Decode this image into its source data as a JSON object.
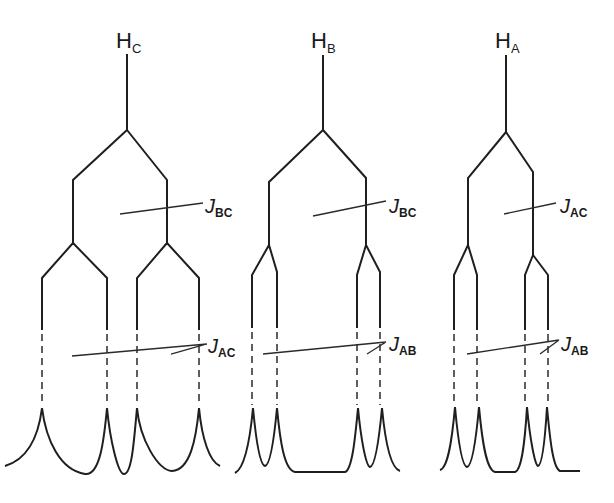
{
  "diagram": {
    "type": "NMR splitting tree diagram",
    "trees": [
      {
        "id": "HC",
        "label_main": "H",
        "label_sub": "C",
        "first_coupling": {
          "main": "J",
          "sub": "BC"
        },
        "second_coupling": {
          "main": "J",
          "sub": "AC"
        },
        "peak_count": 4
      },
      {
        "id": "HB",
        "label_main": "H",
        "label_sub": "B",
        "first_coupling": {
          "main": "J",
          "sub": "BC"
        },
        "second_coupling": {
          "main": "J",
          "sub": "AB"
        },
        "peak_count": 4
      },
      {
        "id": "HA",
        "label_main": "H",
        "label_sub": "A",
        "first_coupling": {
          "main": "J",
          "sub": "AC"
        },
        "second_coupling": {
          "main": "J",
          "sub": "AB"
        },
        "peak_count": 4
      }
    ],
    "colors": {
      "line": "#1f1f1f",
      "background": "#ffffff"
    }
  }
}
